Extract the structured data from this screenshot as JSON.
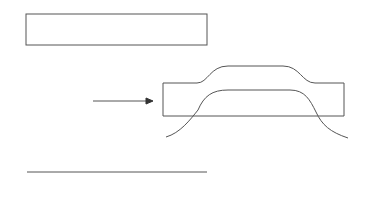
{
  "diagram": {
    "type": "recombination-schematic",
    "arrow_label": "RecA",
    "elements": [
      {
        "name": "double-stranded-dna",
        "description": "duplex DNA drawn as ladder with rungs"
      },
      {
        "name": "single-stranded-dna",
        "description": "single strand with bases as comb"
      },
      {
        "name": "three-strand-intermediate",
        "description": "RecA-mediated strand invasion / D-loop-like structure"
      }
    ],
    "colors": {
      "stroke": "#555555",
      "background": "#ffffff"
    }
  }
}
